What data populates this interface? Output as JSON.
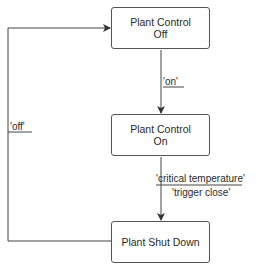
{
  "states": [
    {
      "id": "off",
      "line1": "Plant Control",
      "line2": "Off"
    },
    {
      "id": "on",
      "line1": "Plant Control",
      "line2": "On"
    },
    {
      "id": "shutdown",
      "line1": "Plant Shut Down",
      "line2": ""
    }
  ],
  "transitions": [
    {
      "from": "off",
      "to": "on",
      "event": "'on'",
      "action": ""
    },
    {
      "from": "on",
      "to": "shutdown",
      "event": "'critical temperature'",
      "action": "'trigger close'"
    },
    {
      "from": "shutdown",
      "to": "off",
      "event": "'off'",
      "action": ""
    }
  ]
}
